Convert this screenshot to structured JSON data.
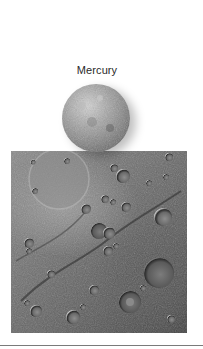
{
  "figure": {
    "title": "Mercury",
    "globe_image": {
      "subject": "mercury-globe",
      "alt": "Mercury globe"
    },
    "surface_image": {
      "subject": "mercury-cratered-surface",
      "alt": "Cratered surface of Mercury"
    },
    "colors": {
      "background": "#ffffff",
      "title_text": "#2a2a2a",
      "divider": "#7a7a7a"
    }
  }
}
